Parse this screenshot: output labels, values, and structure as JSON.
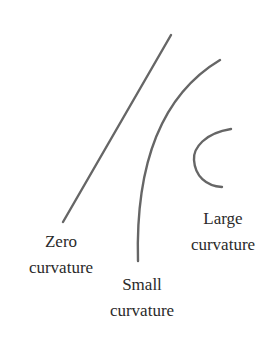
{
  "diagram": {
    "stroke_color": "#666666",
    "text_color": "#2a2a2a",
    "curves": [
      {
        "id": "zero",
        "label_line1": "Zero",
        "label_line2": "curvature",
        "shape": "straight-line",
        "path": "M171,35 L63,222"
      },
      {
        "id": "small",
        "label_line1": "Small",
        "label_line2": "curvature",
        "shape": "gentle-arc",
        "path": "M220,60 C170,90 135,150 138,261"
      },
      {
        "id": "large",
        "label_line1": "Large",
        "label_line2": "curvature",
        "shape": "tight-arc",
        "path": "M231,129 C205,133 193,148 194,160 C195,176 206,186 222,187"
      }
    ]
  }
}
